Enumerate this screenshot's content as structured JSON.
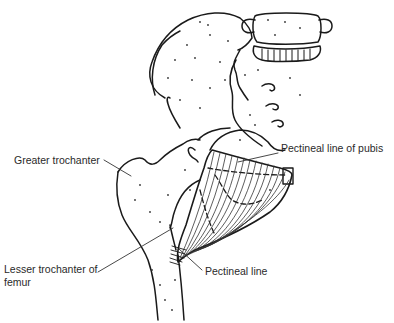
{
  "diagram": {
    "labels": [
      {
        "id": "greater-trochanter",
        "text": "Greater trochanter"
      },
      {
        "id": "pectineal-line-of-pubis",
        "text": "Pectineal line of pubis"
      },
      {
        "id": "lesser-trochanter",
        "line1": "Lesser trochanter of",
        "line2": "femur"
      },
      {
        "id": "pectineal-line",
        "text": "Pectineal line"
      }
    ],
    "colors": {
      "line": "#1a1a1a",
      "background": "#ffffff",
      "label_text": "#2a2a2a"
    }
  }
}
